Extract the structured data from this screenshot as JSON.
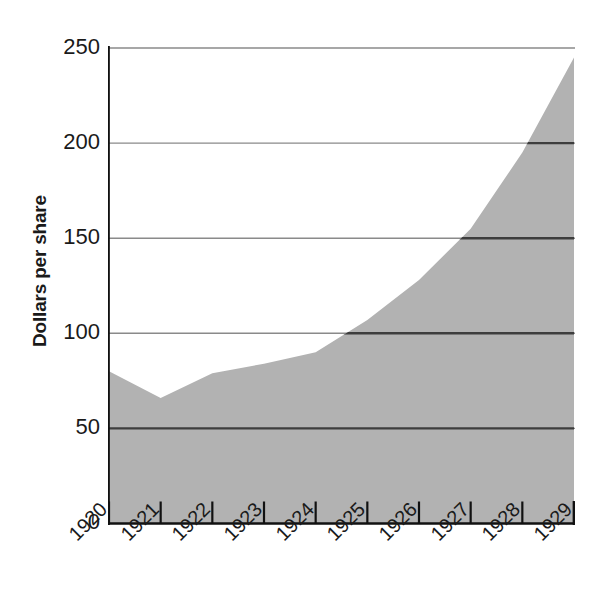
{
  "chart_data": {
    "type": "area",
    "title": "",
    "subtitle": "",
    "xlabel": "",
    "ylabel": "Dollars per share",
    "categories": [
      "1920",
      "1921",
      "1922",
      "1923",
      "1924",
      "1925",
      "1926",
      "1927",
      "1928",
      "1929"
    ],
    "values": [
      80,
      66,
      79,
      84,
      90,
      107,
      128,
      155,
      195,
      245
    ],
    "series": [
      {
        "name": "Dollars per share",
        "values": [
          80,
          66,
          79,
          84,
          90,
          107,
          128,
          155,
          195,
          245
        ]
      }
    ],
    "ylim": [
      0,
      250
    ],
    "y_ticks": [
      0,
      50,
      100,
      150,
      200,
      250
    ],
    "y_tick_labels": [
      "0",
      "50",
      "100",
      "150",
      "200",
      "250"
    ],
    "x_ticks": [
      "1920",
      "1921",
      "1922",
      "1923",
      "1924",
      "1925",
      "1926",
      "1927",
      "1928",
      "1929"
    ],
    "grid": true,
    "grid_axis": "y",
    "legend": false,
    "legend_position": "none",
    "annotations": [],
    "colors": {
      "area_fill": "#b2b2b2",
      "gridline": "#8a8a8a",
      "gridline_over_fill": "#3d3d3d",
      "axis": "#111111",
      "text": "#111111",
      "background": "#ffffff"
    }
  },
  "axes": {
    "y_title": "Dollars per share",
    "y_labels": [
      {
        "value": "250"
      },
      {
        "value": "200"
      },
      {
        "value": "150"
      },
      {
        "value": "100"
      },
      {
        "value": "50"
      },
      {
        "value": "0"
      }
    ],
    "x_labels": [
      {
        "value": "1920"
      },
      {
        "value": "1921"
      },
      {
        "value": "1922"
      },
      {
        "value": "1923"
      },
      {
        "value": "1924"
      },
      {
        "value": "1925"
      },
      {
        "value": "1926"
      },
      {
        "value": "1927"
      },
      {
        "value": "1928"
      },
      {
        "value": "1929"
      }
    ]
  }
}
